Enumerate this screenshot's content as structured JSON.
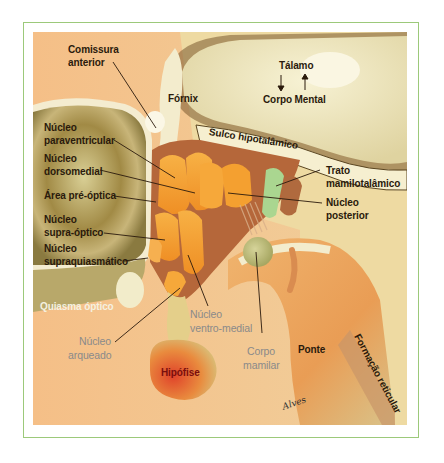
{
  "diagram": {
    "colors": {
      "frame_border": "#9cc97a",
      "background_peach": "#f3c08a",
      "thalamus_cream": "#efe7c0",
      "nuclei_orange": "#f6a330",
      "optic_green": "#b9a66a",
      "pons_orange": "#e89a52",
      "hypophysis_red": "#d9532a",
      "mammillothalamic_green": "#a8d48e"
    },
    "labels": {
      "comissura": "Comissura",
      "anterior": "anterior",
      "fornix": "Fórnix",
      "talamo": "Tálamo",
      "corpo_mental": "Corpo Mental",
      "sulco": "Sulco hipotalâmico",
      "nucleo_para_1": "Núcleo",
      "nucleo_para_2": "paraventricular",
      "nucleo_dorso_1": "Núcleo",
      "nucleo_dorso_2": "dorsomedial",
      "area_pre_optica": "Área pré-óptica",
      "nucleo_supra_1": "Núcleo",
      "nucleo_supra_2": "supra-óptico",
      "nucleo_supraq_1": "Núcleo",
      "nucleo_supraq_2": "supraquiasmático",
      "trato_1": "Trato",
      "trato_2": "mamilotalâmico",
      "nucleo_post_1": "Núcleo",
      "nucleo_post_2": "posterior",
      "quiasma": "Quiasma óptico",
      "nucleo_ventro_1": "Núcleo",
      "nucleo_ventro_2": "ventro-medial",
      "nucleo_arq_1": "Núcleo",
      "nucleo_arq_2": "arqueado",
      "corpo_mamilar_1": "Corpo",
      "corpo_mamilar_2": "mamilar",
      "hipofise": "Hipófise",
      "ponte": "Ponte",
      "formacao": "Formação reticular",
      "signature": "Alves"
    },
    "icons": {
      "arrow_down": "arrow-down-icon",
      "arrow_up": "arrow-up-icon"
    }
  }
}
